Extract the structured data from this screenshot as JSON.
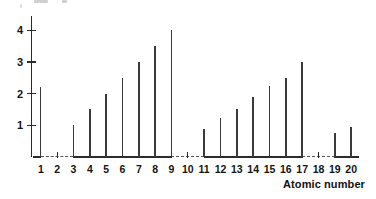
{
  "chart_data": {
    "type": "bar",
    "title": "",
    "subtitle": "",
    "xlabel": "Atomic number",
    "ylabel": "",
    "categories": [
      1,
      2,
      3,
      4,
      5,
      6,
      7,
      8,
      9,
      10,
      11,
      12,
      13,
      14,
      15,
      16,
      17,
      18,
      19,
      20
    ],
    "values": [
      2.2,
      null,
      1.0,
      1.5,
      2.0,
      2.5,
      3.0,
      3.5,
      4.0,
      null,
      0.88,
      1.22,
      1.5,
      1.9,
      2.25,
      2.5,
      3.0,
      null,
      0.75,
      0.95
    ],
    "series": [
      {
        "name": "value",
        "values": [
          2.2,
          null,
          1.0,
          1.5,
          2.0,
          2.5,
          3.0,
          3.5,
          4.0,
          null,
          0.88,
          1.22,
          1.5,
          1.9,
          2.25,
          2.5,
          3.0,
          null,
          0.75,
          0.95
        ]
      }
    ],
    "missing_categories": [
      2,
      10,
      18
    ],
    "xlim": [
      0.4,
      20.6
    ],
    "ylim": [
      0,
      4.45
    ],
    "ytick_values": [
      1,
      2,
      3,
      4
    ],
    "ytick_labels": [
      "1",
      "2",
      "3",
      "4"
    ],
    "xtick_labels": [
      "1",
      "2",
      "3",
      "4",
      "5",
      "6",
      "7",
      "8",
      "9",
      "10",
      "11",
      "12",
      "13",
      "14",
      "15",
      "16",
      "17",
      "18",
      "19",
      "20"
    ],
    "grid": false,
    "legend": null,
    "legend_position": "none",
    "baseline_segments": [
      {
        "from": 0.55,
        "to": 1.0,
        "style": "solid"
      },
      {
        "from": 1.0,
        "to": 3.0,
        "style": "dashed"
      },
      {
        "from": 3.0,
        "to": 9.0,
        "style": "solid"
      },
      {
        "from": 9.0,
        "to": 11.0,
        "style": "dashed"
      },
      {
        "from": 11.0,
        "to": 17.0,
        "style": "solid"
      },
      {
        "from": 17.0,
        "to": 19.0,
        "style": "dashed"
      },
      {
        "from": 19.0,
        "to": 20.45,
        "style": "solid"
      }
    ],
    "colors": {
      "stem": "#3a3a3a",
      "axis": "#2b2b2b",
      "dashed_axis": "#555555",
      "text": "#141414",
      "background": "#ffffff"
    }
  },
  "axis_title": {
    "text": "Atomic number"
  }
}
